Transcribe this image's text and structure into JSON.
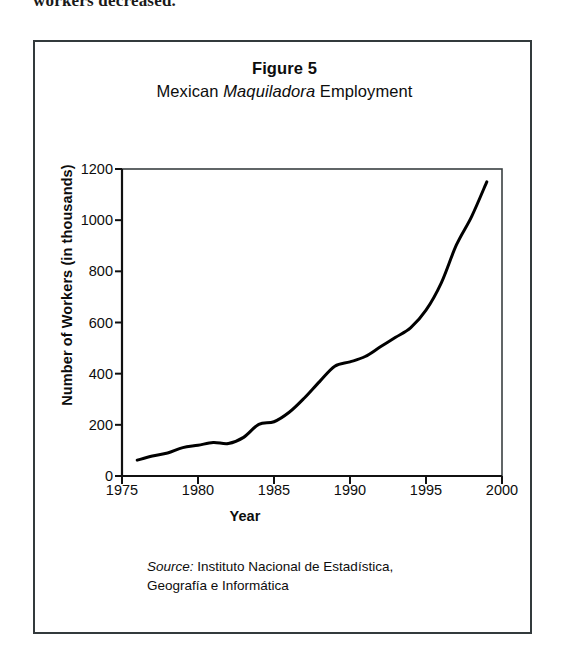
{
  "page": {
    "top_text_fragment": "workers decreased."
  },
  "figure": {
    "title_main": "Figure 5",
    "title_sub_prefix": "Mexican ",
    "title_sub_italic": "Maquiladora",
    "title_sub_suffix": " Employment",
    "source_label": "Source:",
    "source_line1": " Instituto Nacional de Estadística,",
    "source_line2": "Geografía e Informática",
    "frame_color": "#333a3c"
  },
  "chart_data": {
    "type": "line",
    "xlabel": "Year",
    "ylabel": "Number of Workers (in thousands)",
    "xlim": [
      1975,
      2000
    ],
    "ylim": [
      0,
      1200
    ],
    "xticks": [
      1975,
      1980,
      1985,
      1990,
      1995,
      2000
    ],
    "xtick_labels": [
      "1975",
      "1980",
      "1985",
      "1990",
      "1995",
      "2000"
    ],
    "yticks": [
      0,
      200,
      400,
      600,
      800,
      1000,
      1200
    ],
    "ytick_labels": [
      "0",
      "200",
      "400",
      "600",
      "800",
      "1000",
      "1200"
    ],
    "grid": false,
    "legend": false,
    "line_color": "#000000",
    "line_width": 3,
    "series": [
      {
        "name": "Maquiladora employment",
        "x": [
          1976,
          1977,
          1978,
          1979,
          1980,
          1981,
          1982,
          1983,
          1984,
          1985,
          1986,
          1987,
          1988,
          1989,
          1990,
          1991,
          1992,
          1993,
          1994,
          1995,
          1996,
          1997,
          1998,
          1999
        ],
        "values": [
          62,
          78,
          90,
          111,
          120,
          131,
          127,
          151,
          202,
          212,
          249,
          305,
          369,
          429,
          446,
          467,
          505,
          542,
          580,
          648,
          754,
          903,
          1014,
          1150
        ]
      }
    ]
  }
}
